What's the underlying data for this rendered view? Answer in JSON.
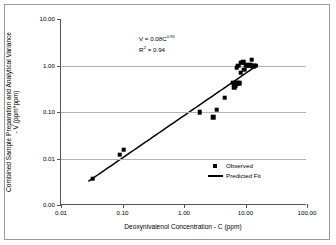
{
  "chart_data": {
    "type": "scatter",
    "title": "",
    "xlabel": "Deoxynivalenol Concentration - C (ppm)",
    "ylabel": "Combined Sample Preparation and Analytical Variance - V (ppm*ppm)",
    "ylabel_line1": "Combined Sample Preparation and Analytical Variance",
    "ylabel_line2": "- V (ppm*ppm)",
    "xscale": "log",
    "yscale": "log",
    "xlim": [
      0.01,
      100.0
    ],
    "ylim": [
      0.001,
      10.0
    ],
    "grid": "horizontal",
    "legend_position": "inside-lower-right",
    "xticks": [
      "0.01",
      "0.10",
      "1.00",
      "10.00",
      "100.00"
    ],
    "xtick_values": [
      0.01,
      0.1,
      1.0,
      10.0,
      100.0
    ],
    "yticks": [
      "0.00",
      "0.01",
      "0.10",
      "1.00",
      "10.00"
    ],
    "ytick_values": [
      0.001,
      0.01,
      0.1,
      1.0,
      10.0
    ],
    "annotations": [
      {
        "text_prefix": "V = 0.08C",
        "exponent": "0.91"
      },
      {
        "text_prefix": "R",
        "superscript": "2",
        "text_suffix": " = 0.94"
      }
    ],
    "equation": "V = 0.08C^0.91",
    "r_squared": "0.94",
    "series": [
      {
        "name": "Observed",
        "marker": "square",
        "color": "#000000",
        "points": [
          [
            0.033,
            0.0037
          ],
          [
            0.09,
            0.012
          ],
          [
            0.105,
            0.0155
          ],
          [
            1.8,
            0.1
          ],
          [
            3.0,
            0.078
          ],
          [
            3.4,
            0.112
          ],
          [
            4.6,
            0.205
          ],
          [
            6.3,
            0.43
          ],
          [
            6.6,
            0.34
          ],
          [
            6.8,
            0.38
          ],
          [
            7.0,
            0.43
          ],
          [
            7.4,
            0.42
          ],
          [
            8.0,
            0.42
          ],
          [
            7.2,
            0.9
          ],
          [
            7.6,
            0.99
          ],
          [
            8.3,
            0.7
          ],
          [
            8.6,
            1.15
          ],
          [
            9.2,
            1.18
          ],
          [
            9.6,
            0.82
          ],
          [
            10.2,
            1.02
          ],
          [
            10.8,
            0.99
          ],
          [
            11.4,
            1.0
          ],
          [
            12.0,
            1.02
          ],
          [
            12.6,
            1.32
          ],
          [
            13.2,
            0.98
          ],
          [
            13.8,
            1.0
          ],
          [
            14.6,
            0.99
          ]
        ]
      },
      {
        "name": "Predicted Fit",
        "marker": "line",
        "color": "#000000",
        "fit": {
          "a": 0.08,
          "b": 0.91,
          "x_start": 0.028,
          "x_end": 16.5
        }
      }
    ],
    "legend": [
      {
        "label": "Observed",
        "key": "square-marker"
      },
      {
        "label": "Predicted Fit",
        "key": "line-swatch"
      }
    ]
  }
}
